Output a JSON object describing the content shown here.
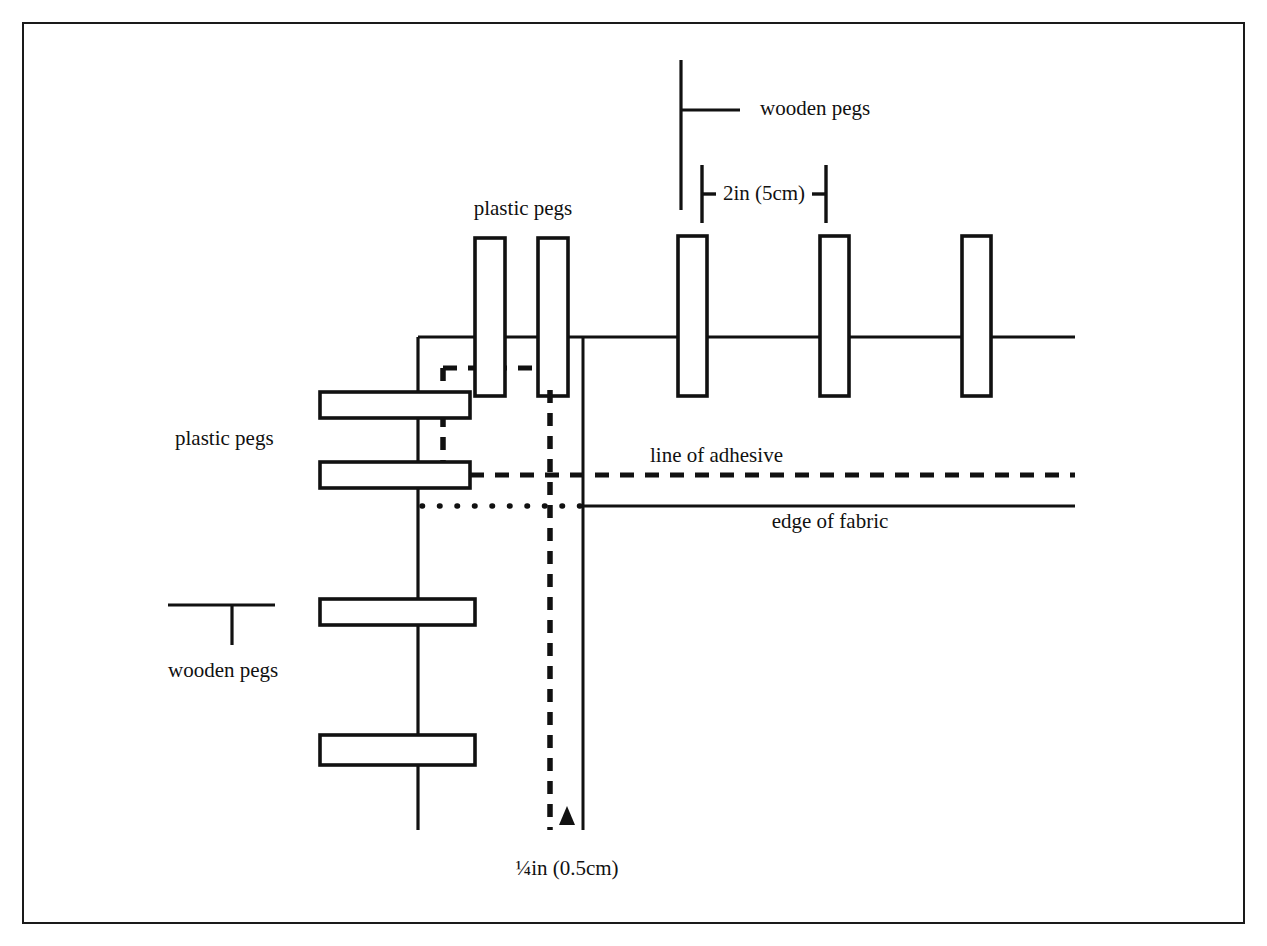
{
  "figure": {
    "background_color": "#ffffff",
    "ink_color": "#111111",
    "frame": {
      "x": 22,
      "y": 22,
      "width": 1223,
      "height": 902
    }
  },
  "labels": {
    "wooden_pegs_top": "wooden pegs",
    "wooden_pegs_bottom": "wooden pegs",
    "plastic_pegs_top": "plastic pegs",
    "plastic_pegs_left": "plastic pegs",
    "line_of_adhesive": "line of adhesive",
    "edge_of_fabric": "edge of fabric",
    "dimension_large": "2in (5cm)",
    "dimension_small": "¼in (0.5cm)"
  },
  "legend": {
    "wooden_peg_symbol_name": "t-shape-peg-symbol",
    "plastic_peg_symbol_name": "rectangle-peg-symbol"
  },
  "geometry": {
    "top_rail_y": 337,
    "left_rail_x": 418,
    "adhesive_y": 475,
    "fabric_edge_y": 506,
    "vertical_dashed_x": 550,
    "vertical_solid_x": 583,
    "rail_right_end": 1075,
    "adhesive_right_end": 1075,
    "fabric_right_end": 1075
  },
  "pegs": {
    "vertical": [
      {
        "id": "plastic-peg-v1",
        "type": "plastic",
        "x": 475,
        "y": 238,
        "width": 30,
        "height": 158
      },
      {
        "id": "plastic-peg-v2",
        "type": "plastic",
        "x": 538,
        "y": 238,
        "width": 30,
        "height": 158
      },
      {
        "id": "wooden-peg-v3",
        "type": "wooden",
        "x": 678,
        "y": 236,
        "width": 29,
        "height": 160
      },
      {
        "id": "wooden-peg-v4",
        "type": "wooden",
        "x": 820,
        "y": 236,
        "width": 29,
        "height": 160
      },
      {
        "id": "wooden-peg-v5",
        "type": "wooden",
        "x": 962,
        "y": 236,
        "width": 29,
        "height": 160
      }
    ],
    "horizontal": [
      {
        "id": "plastic-peg-h1",
        "type": "plastic",
        "x": 320,
        "y": 392,
        "width": 150,
        "height": 26
      },
      {
        "id": "plastic-peg-h2",
        "type": "plastic",
        "x": 320,
        "y": 462,
        "width": 150,
        "height": 26
      },
      {
        "id": "wooden-peg-h3",
        "type": "wooden",
        "x": 320,
        "y": 599,
        "width": 155,
        "height": 26
      },
      {
        "id": "wooden-peg-h4",
        "type": "wooden",
        "x": 320,
        "y": 735,
        "width": 155,
        "height": 30
      }
    ]
  },
  "dimension_markers": {
    "large": {
      "left_tick_x": 700,
      "right_tick_x": 826,
      "y": 194,
      "tick_top": 165,
      "tick_bottom": 223
    },
    "small": {
      "from_x": 550,
      "to_x": 583,
      "y": 818,
      "arrow_x": 567
    }
  }
}
